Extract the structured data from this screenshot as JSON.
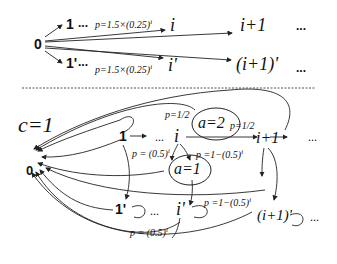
{
  "top": {
    "source": "0",
    "upper_branch": {
      "first": "1",
      "dots": "...",
      "prob": "p=1.5×(0.25)",
      "prob_exp": "i",
      "node_i": "i",
      "node_i1": "i+1",
      "tail": "..."
    },
    "lower_branch": {
      "first": "1'",
      "dots": "...",
      "prob": "p=1.5×(0.25)",
      "prob_exp": "i",
      "node_i": "i'",
      "node_i1": "(i+1)'",
      "tail": "..."
    }
  },
  "bottom": {
    "condition": "c=1",
    "zero": "0",
    "upper_chain": {
      "n1": "1",
      "dots": "...",
      "ni": "i",
      "ni1": "i+1",
      "tail": "..."
    },
    "lower_chain": {
      "n1": "1'",
      "dots": "...",
      "ni": "i'",
      "ni1": "(i+1)'",
      "tail": "..."
    },
    "action_a2": "a=2",
    "action_a1": "a=1",
    "probs": {
      "p_half_top": "p=1/2",
      "p_half_right": "p=1/2",
      "p_05i": "p = (0.5)",
      "p_05i_exp": "i",
      "p_1m": "p =1−(0.5)",
      "p_1m_exp": "i",
      "p_1m_lower": "p =1−(0.5)",
      "p_1m_lower_exp": "i",
      "p_05i_lower": "p = (0.5)",
      "p_05i_lower_exp": "i"
    }
  }
}
